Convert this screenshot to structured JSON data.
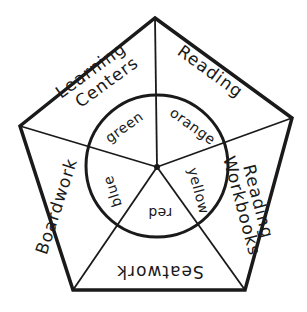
{
  "diagram": {
    "type": "pentagon-wheel",
    "colors": {
      "stroke": "#1a1a1a",
      "background": "#ffffff"
    },
    "outer_sections": [
      {
        "label": "Reading"
      },
      {
        "label_line1": "Reading",
        "label_line2": "Workbooks"
      },
      {
        "label": "Seatwork"
      },
      {
        "label": "Boardwork"
      },
      {
        "label_line1": "Learning",
        "label_line2": "Centers"
      }
    ],
    "inner_sections": [
      {
        "label": "orange"
      },
      {
        "label": "yellow"
      },
      {
        "label": "red"
      },
      {
        "label": "blue"
      },
      {
        "label": "green"
      }
    ]
  }
}
